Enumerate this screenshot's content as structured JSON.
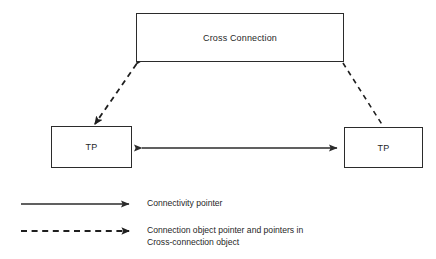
{
  "diagram": {
    "background_color": "#ffffff",
    "line_color": "#2b2b2b",
    "text_color": "#1f1f1f",
    "nodes": [
      {
        "id": "cross-connection",
        "label": "Cross Connection"
      },
      {
        "id": "tp-left",
        "label": "TP"
      },
      {
        "id": "tp-right",
        "label": "TP"
      }
    ],
    "connectors": [
      {
        "id": "tp-to-tp",
        "style": "solid",
        "arrowheads": "both",
        "from": "tp-left",
        "to": "tp-right",
        "meaning": "Connectivity pointer"
      },
      {
        "id": "cross-connection-to-tp-left",
        "style": "dashed",
        "arrowheads": "both",
        "from": "cross-connection",
        "to": "tp-left",
        "meaning": "Connection object pointer and pointers in Cross-connection object"
      },
      {
        "id": "cross-connection-to-tp-right",
        "style": "dashed",
        "arrowheads": "none",
        "from": "cross-connection",
        "to": "tp-right",
        "meaning": "Connection object pointer and pointers in Cross-connection object"
      }
    ]
  },
  "legend": {
    "entries": [
      {
        "id": "connectivity-pointer",
        "style": "solid",
        "label": "Connectivity pointer"
      },
      {
        "id": "connection-object-pointer",
        "style": "dashed",
        "label": "Connection object pointer and pointers in\nCross-connection object"
      }
    ]
  }
}
